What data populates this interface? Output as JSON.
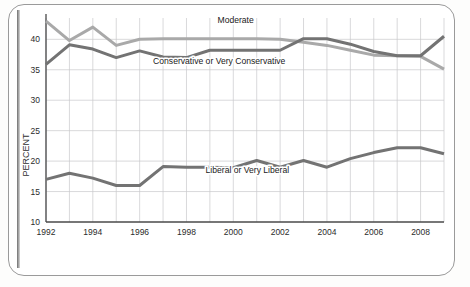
{
  "chart_data": {
    "type": "line",
    "title": "",
    "xlabel": "",
    "ylabel": "PERCENT",
    "xlim": [
      1992,
      2009
    ],
    "ylim": [
      10,
      43.5
    ],
    "grid": true,
    "legend_position": "inline-annotations",
    "y_ticks": [
      10,
      15,
      20,
      25,
      30,
      35,
      40
    ],
    "x_ticks": [
      1992,
      1994,
      1996,
      1998,
      2000,
      2002,
      2004,
      2006,
      2008
    ],
    "x_gridline_years": [
      1992,
      1993,
      1994,
      1995,
      1996,
      1997,
      1998,
      1999,
      2000,
      2001,
      2002,
      2003,
      2004,
      2005,
      2006,
      2007,
      2008,
      2009
    ],
    "x": [
      1992,
      1993,
      1994,
      1995,
      1996,
      1997,
      1998,
      1999,
      2000,
      2001,
      2002,
      2003,
      2004,
      2005,
      2006,
      2007,
      2008,
      2009
    ],
    "series": [
      {
        "name": "Moderate",
        "color": "#a9a9a9",
        "values": [
          43.0,
          39.8,
          42.0,
          39.0,
          40.0,
          40.1,
          40.1,
          40.1,
          40.1,
          40.1,
          40.0,
          39.5,
          39.0,
          38.2,
          37.4,
          37.3,
          37.2,
          35.1
        ]
      },
      {
        "name": "Conservative or Very Conservative",
        "color": "#737373",
        "values": [
          35.9,
          39.1,
          38.4,
          37.0,
          38.1,
          37.1,
          37.0,
          38.2,
          38.2,
          38.2,
          38.2,
          40.1,
          40.1,
          39.2,
          38.0,
          37.3,
          37.3,
          40.5
        ]
      },
      {
        "name": "Liberal or Very Liberal",
        "color": "#737373",
        "values": [
          17.0,
          18.0,
          17.2,
          16.0,
          16.0,
          19.1,
          19.0,
          19.0,
          18.9,
          20.1,
          19.0,
          20.1,
          19.0,
          20.4,
          21.4,
          22.2,
          22.2,
          21.2
        ]
      }
    ],
    "annotations": [
      {
        "text": "Moderate",
        "x": 2000.1,
        "y": 42.6
      },
      {
        "text": "Conservative or Very Conservative",
        "x": 1999.4,
        "y": 36.0
      },
      {
        "text": "Liberal or Very Liberal",
        "x": 2000.6,
        "y": 18.0
      }
    ]
  }
}
